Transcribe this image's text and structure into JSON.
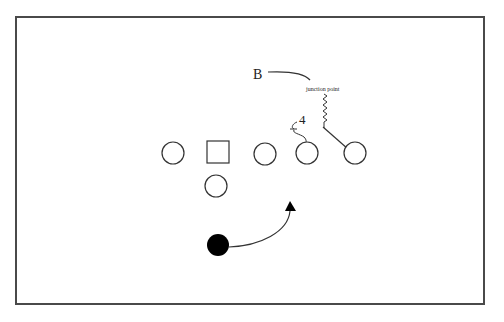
{
  "diagram": {
    "type": "football-play",
    "labels": {
      "b_label": "B",
      "junction_label": "junction point",
      "number_label": "4"
    },
    "players": [
      {
        "id": "lineman-1",
        "shape": "circle",
        "x": 173,
        "y": 152
      },
      {
        "id": "center",
        "shape": "square",
        "x": 218,
        "y": 152
      },
      {
        "id": "lineman-3",
        "shape": "circle",
        "x": 265,
        "y": 154
      },
      {
        "id": "lineman-4",
        "shape": "circle",
        "x": 307,
        "y": 153
      },
      {
        "id": "end",
        "shape": "circle",
        "x": 355,
        "y": 153
      },
      {
        "id": "back",
        "shape": "circle",
        "x": 216,
        "y": 186
      },
      {
        "id": "ball-carrier",
        "shape": "filled-circle",
        "x": 218,
        "y": 245
      }
    ],
    "colors": {
      "stroke": "#333333",
      "fill": "#000000",
      "border": "#4a4a4a"
    }
  }
}
